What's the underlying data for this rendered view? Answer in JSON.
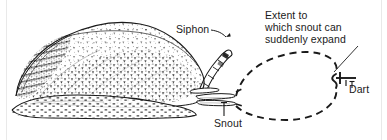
{
  "figure": {
    "background_color": "#ffffff",
    "ink_color": "#1a1a1a",
    "width": 387,
    "height": 140
  },
  "labels": {
    "extent": "Extent to\nwhich snout can\nsuddenly expand",
    "siphon": "Siphon",
    "snout": "Snout",
    "dart": "Dart"
  },
  "annotations": {
    "siphon_leader": "curved-leader-with-arrowhead",
    "snout_leader": "vertical-leader-line",
    "extent_leader": "diagonal-leader-line",
    "dart_leader": "short-vertical-leader-line"
  },
  "elements": {
    "snail": "stippled-cone-snail-body",
    "expansion_outline": "dashed-balloon-outline",
    "dart_marker": "barbed-dart-tip"
  }
}
